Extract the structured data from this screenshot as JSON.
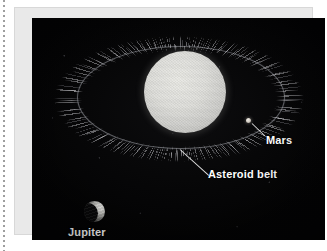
{
  "figure": {
    "kind": "astronomy-illustration",
    "background_color": "#040405",
    "label_color": "#ffffff"
  },
  "labels": {
    "mars": "Mars",
    "asteroid_belt": "Asteroid belt",
    "jupiter": "Jupiter"
  },
  "objects": {
    "sun": {
      "name": "sun-sphere",
      "color": "#dededa"
    },
    "mars": {
      "name": "mars-dot",
      "color": "#cfc9bf"
    },
    "jupiter": {
      "name": "jupiter-crescent",
      "color": "#d6d6d2"
    },
    "mars_orbit": {
      "name": "mars-orbit-ellipse",
      "color": "#b9bcc4"
    },
    "asteroid_belt": {
      "name": "asteroid-belt-ring",
      "color": "#ebebf0"
    }
  }
}
